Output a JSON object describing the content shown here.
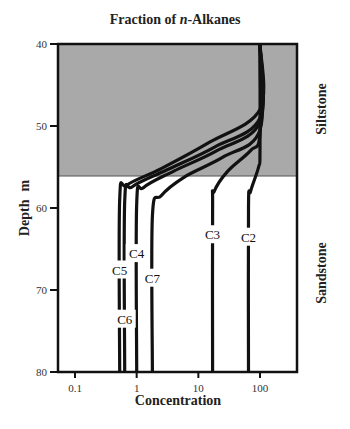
{
  "chart_data": {
    "type": "line",
    "title_prefix": "Fraction of ",
    "title_italic": "n",
    "title_suffix": "-Alkanes",
    "xlabel": "Concentration",
    "ylabel": "Depth",
    "yunit": "m",
    "xscale": "log",
    "xlim": [
      0.05,
      400
    ],
    "ylim": [
      80,
      40
    ],
    "xticks": [
      {
        "value": 0.1,
        "label": "0.1"
      },
      {
        "value": 1,
        "label": "1"
      },
      {
        "value": 10,
        "label": "10"
      },
      {
        "value": 100,
        "label": "100"
      }
    ],
    "yticks": [
      {
        "value": 40,
        "label": "40"
      },
      {
        "value": 50,
        "label": "50"
      },
      {
        "value": 60,
        "label": "60"
      },
      {
        "value": 70,
        "label": "70"
      },
      {
        "value": 80,
        "label": "80"
      }
    ],
    "zones": [
      {
        "name": "Siltstone",
        "depth_top": 40,
        "depth_bottom": 56.1,
        "fill": "#a9a9a9"
      },
      {
        "name": "Sandstone",
        "depth_top": 56.1,
        "depth_bottom": 80,
        "fill": "#ffffff"
      }
    ],
    "series": [
      {
        "name": "C2",
        "label_depth": 63.5,
        "points": [
          [
            100,
            40
          ],
          [
            100,
            53
          ],
          [
            95,
            55
          ],
          [
            70,
            58
          ],
          [
            65,
            60
          ],
          [
            65,
            80
          ]
        ]
      },
      {
        "name": "C3",
        "label_depth": 63.2,
        "points": [
          [
            100,
            40
          ],
          [
            100,
            51
          ],
          [
            70,
            53
          ],
          [
            30,
            55.5
          ],
          [
            18,
            58
          ],
          [
            17,
            60
          ],
          [
            17,
            80
          ]
        ]
      },
      {
        "name": "C4",
        "label_depth": 65.5,
        "points": [
          [
            100,
            40
          ],
          [
            100,
            49.5
          ],
          [
            20,
            53
          ],
          [
            4,
            55.5
          ],
          [
            1.3,
            57.5
          ],
          [
            1.0,
            59.5
          ],
          [
            1.0,
            80
          ]
        ]
      },
      {
        "name": "C5",
        "label_depth": 67.5,
        "points": [
          [
            100,
            40
          ],
          [
            100,
            48
          ],
          [
            15,
            52
          ],
          [
            2.5,
            55.2
          ],
          [
            0.7,
            57.2
          ],
          [
            0.53,
            59
          ],
          [
            0.53,
            80
          ]
        ]
      },
      {
        "name": "C6",
        "label_depth": 73.5,
        "points": [
          [
            100,
            40
          ],
          [
            100,
            49
          ],
          [
            18,
            52.6
          ],
          [
            3,
            55.4
          ],
          [
            0.85,
            57.4
          ],
          [
            0.64,
            59.2
          ],
          [
            0.64,
            80
          ]
        ]
      },
      {
        "name": "C7",
        "label_depth": 68.5,
        "points": [
          [
            100,
            40
          ],
          [
            100,
            50.5
          ],
          [
            25,
            53.8
          ],
          [
            6,
            56.2
          ],
          [
            2.5,
            58.5
          ],
          [
            1.8,
            61
          ],
          [
            1.8,
            80
          ]
        ]
      }
    ],
    "layout": {
      "grid": false,
      "legend": "inline labels",
      "plot_box": {
        "left": 58,
        "top": 44,
        "right": 297,
        "bottom": 372
      }
    }
  }
}
